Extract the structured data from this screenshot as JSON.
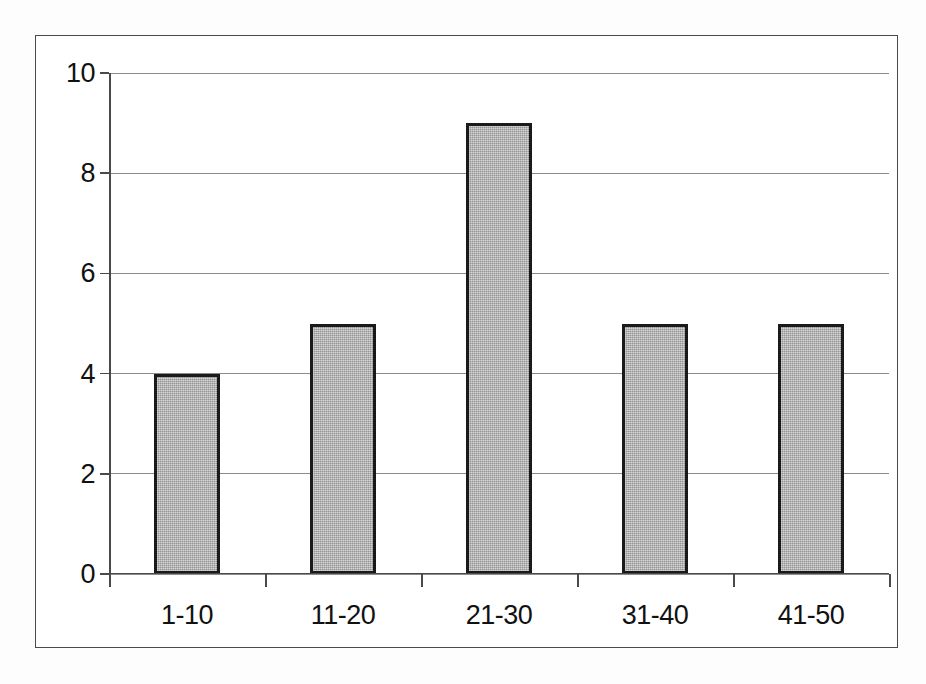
{
  "chart_data": {
    "type": "bar",
    "title": "",
    "subtitle": "",
    "xlabel": "",
    "ylabel": "",
    "categories": [
      "1-10",
      "11-20",
      "21-30",
      "31-40",
      "41-50"
    ],
    "values": [
      4,
      5,
      9,
      5,
      5
    ],
    "series": [
      {
        "name": "Frequency",
        "values": [
          4,
          5,
          9,
          5,
          5
        ]
      }
    ],
    "ylim": [
      0,
      10
    ],
    "ytick_labels": [
      "0",
      "2",
      "4",
      "6",
      "8",
      "10"
    ],
    "ytick_values": [
      0,
      2,
      4,
      6,
      8,
      10
    ],
    "grid": true,
    "grid_axis": "y",
    "legend": false,
    "legend_position": "none",
    "annotations": [],
    "colors": {
      "bar_fill": "#a9a9a9",
      "bar_border": "#1a1a1a",
      "gridline": "#8b8b8b",
      "axis": "#4a4a4a",
      "frame": "#4a4a4a",
      "text": "#111111",
      "background": "#ffffff"
    }
  }
}
